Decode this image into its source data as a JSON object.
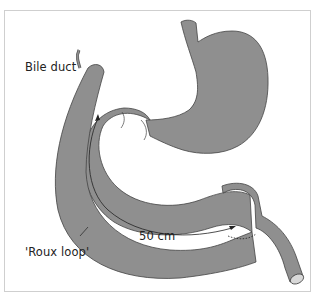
{
  "diagram": {
    "type": "anatomical",
    "labels": {
      "bile_duct": "Bile duct",
      "roux_loop": "'Roux loop'",
      "length": "50 cm"
    },
    "colors": {
      "organ_fill": "#8f8f8f",
      "outline": "#444444",
      "frame": "#cfcfcf",
      "text": "#222222"
    }
  }
}
